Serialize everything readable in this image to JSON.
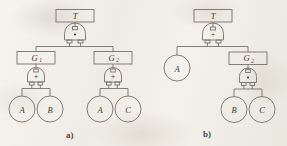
{
  "figure": {
    "kind": "fault-tree-diagram-pair",
    "background_color": "#f2efe9",
    "line_color": "#6e6b66",
    "text_color": "#3b3935",
    "subfigures": [
      {
        "id": "a",
        "caption": "a)",
        "top_event": "T",
        "top_gate": {
          "type": "AND",
          "symbol": "·"
        },
        "intermediate_events": [
          "G₁",
          "G₂"
        ],
        "gates": [
          {
            "parent": "G₁",
            "type": "OR",
            "symbol": "+"
          },
          {
            "parent": "G₂",
            "type": "OR",
            "symbol": "+"
          }
        ],
        "basic_events": [
          "A",
          "B",
          "A",
          "C"
        ]
      },
      {
        "id": "b",
        "caption": "b)",
        "top_event": "T",
        "top_gate": {
          "type": "OR",
          "symbol": "+"
        },
        "intermediate_events": [
          "G₂"
        ],
        "gates": [
          {
            "parent": "G₂",
            "type": "AND",
            "symbol": "·"
          }
        ],
        "basic_events": [
          "A",
          "B",
          "C"
        ]
      }
    ]
  },
  "a": {
    "caption": "a)",
    "top_box": "T",
    "top_gate_symbol": "·",
    "g1_box": "G₁",
    "g2_box": "G₂",
    "g1_gate_symbol": "+",
    "g2_gate_symbol": "+",
    "leaf_1": "A",
    "leaf_2": "B",
    "leaf_3": "A",
    "leaf_4": "C"
  },
  "b": {
    "caption": "b)",
    "top_box": "T",
    "top_gate_symbol": "+",
    "leaf_a": "A",
    "g2_box": "G₂",
    "g2_gate_symbol": "·",
    "leaf_b": "B",
    "leaf_c": "C"
  }
}
